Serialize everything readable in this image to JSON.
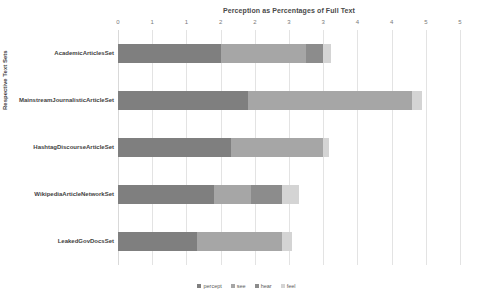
{
  "chart_data": {
    "type": "bar",
    "orientation": "horizontal",
    "stacked": true,
    "title": "Perception as Percentages of Full Text",
    "xlabel": "",
    "ylabel": "Respective Text Sets",
    "xlim": [
      0,
      5
    ],
    "xticks": [
      0,
      0.5,
      1,
      1.5,
      2,
      2.5,
      3,
      3.5,
      4,
      4.5,
      5
    ],
    "xtick_labels": [
      "0",
      "1",
      "1",
      "2",
      "2",
      "3",
      "3",
      "4",
      "4",
      "5",
      "5"
    ],
    "grid": true,
    "legend_position": "bottom",
    "categories": [
      "AcademicArticlesSet",
      "MainstreamJournalisticArticleSet",
      "HashtagDiscourseArticleSet",
      "WikipediaArticleNetworkSet",
      "LeakedGovDocsSet"
    ],
    "series": [
      {
        "name": "percept",
        "color": "#7f7f7f",
        "values": [
          1.5,
          1.9,
          1.65,
          1.4,
          1.15
        ]
      },
      {
        "name": "see",
        "color": "#a6a6a6",
        "values": [
          1.25,
          2.4,
          1.35,
          0.55,
          1.25
        ]
      },
      {
        "name": "hear",
        "color": "#8c8c8c",
        "values": [
          0.25,
          0.0,
          0.0,
          0.45,
          0.0
        ]
      },
      {
        "name": "feel",
        "color": "#d4d4d4",
        "values": [
          0.12,
          0.15,
          0.08,
          0.25,
          0.15
        ]
      }
    ],
    "totals": [
      3.12,
      4.45,
      3.08,
      2.65,
      2.55
    ]
  },
  "legend": {
    "items": [
      {
        "label": "percept",
        "color": "#7f7f7f"
      },
      {
        "label": "see",
        "color": "#a6a6a6"
      },
      {
        "label": "hear",
        "color": "#8c8c8c"
      },
      {
        "label": "feel",
        "color": "#d4d4d4"
      }
    ]
  }
}
